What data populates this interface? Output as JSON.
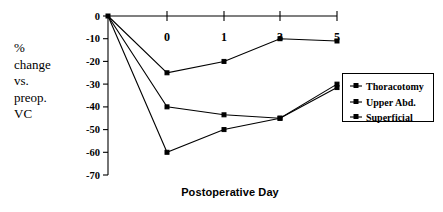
{
  "chart_data": {
    "type": "line",
    "title": "",
    "xlabel": "Postoperative Day",
    "ylabel": "% change vs. preop. VC",
    "ylabel_lines": [
      "%",
      "change",
      "vs.",
      "preop.",
      "VC"
    ],
    "x": [
      "pre",
      "0",
      "1",
      "3",
      "5"
    ],
    "x_tick_labels": [
      "0",
      "1",
      "3",
      "5"
    ],
    "y_tick_labels": [
      "0",
      "-10",
      "-20",
      "-30",
      "-40",
      "-50",
      "-60",
      "-70"
    ],
    "ylim": [
      -70,
      0
    ],
    "grid": false,
    "legend_position": "right",
    "series": [
      {
        "name": "Thoracotomy",
        "values": [
          0,
          -25,
          -20,
          -10,
          -11
        ]
      },
      {
        "name": "Upper Abd.",
        "values": [
          0,
          -40,
          -43.5,
          -45,
          -30
        ]
      },
      {
        "name": "Superficial",
        "values": [
          0,
          -60,
          -50,
          -45,
          -31.5
        ]
      }
    ],
    "colors": {
      "line": "#000000",
      "marker": "#000000",
      "axis": "#000000",
      "background": "#ffffff"
    }
  },
  "legend": {
    "entries": [
      {
        "label": "Thoracotomy"
      },
      {
        "label": "Upper Abd."
      },
      {
        "label": "Superficial"
      }
    ]
  },
  "axes": {
    "x_title": "Postoperative Day"
  }
}
